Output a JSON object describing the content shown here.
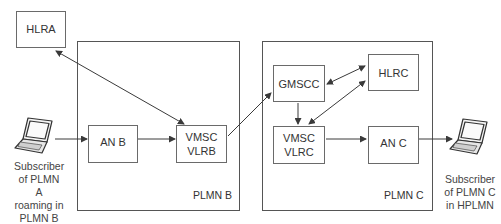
{
  "nodes": {
    "hlra": {
      "label": "HLRA"
    },
    "an_b": {
      "label": "AN B"
    },
    "vmsc_vlrb": {
      "line1": "VMSC",
      "line2": "VLRB"
    },
    "gmscc": {
      "label": "GMSCC"
    },
    "hlrc": {
      "label": "HLRC"
    },
    "vmsc_vlrc": {
      "line1": "VMSC",
      "line2": "VLRC"
    },
    "an_c": {
      "label": "AN C"
    }
  },
  "regions": {
    "plmn_b": {
      "label": "PLMN B"
    },
    "plmn_c": {
      "label": "PLMN C"
    }
  },
  "subscribers": {
    "a": {
      "lines": [
        "Subscriber",
        "of PLMN A",
        "roaming in",
        "PLMN B"
      ],
      "icon": "laptop-icon"
    },
    "c": {
      "lines": [
        "Subscriber",
        "of PLMN C",
        "in HPLMN"
      ],
      "icon": "laptop-icon"
    }
  },
  "colors": {
    "line": "#3a3a3a",
    "box_border": "#6a6a6a",
    "text": "#333333"
  }
}
